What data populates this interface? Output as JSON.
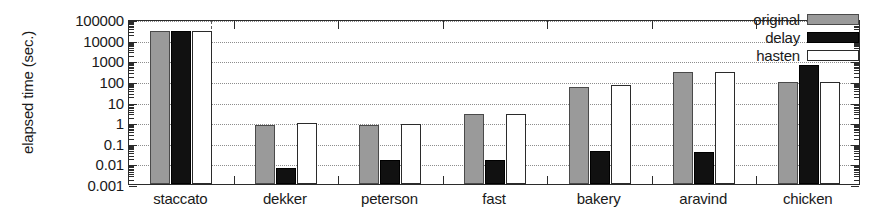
{
  "chart_data": {
    "type": "bar",
    "title": "",
    "xlabel": "",
    "ylabel": "elapsed time (sec.)",
    "yscale": "log",
    "ylim": [
      0.001,
      100000
    ],
    "ytick_labels": [
      "0.001",
      "0.01",
      "0.1",
      "1",
      "10",
      "100",
      "1000",
      "10000",
      "100000"
    ],
    "ytick_values": [
      0.001,
      0.01,
      0.1,
      1,
      10,
      100,
      1000,
      10000,
      100000
    ],
    "grid": "horizontal-dotted",
    "legend_position": "top-right",
    "categories": [
      "staccato",
      "dekker",
      "peterson",
      "fast",
      "bakery",
      "aravind",
      "chicken"
    ],
    "series": [
      {
        "name": "original",
        "color": "#9a9a9a",
        "values": [
          25000,
          0.7,
          0.7,
          2.5,
          50,
          280,
          90
        ]
      },
      {
        "name": "delay",
        "color": "#111111",
        "values": [
          25000,
          0.006,
          0.015,
          0.015,
          0.04,
          0.035,
          600
        ]
      },
      {
        "name": "hasten",
        "color": "#ffffff",
        "values": [
          25000,
          0.9,
          0.85,
          2.5,
          60,
          280,
          90
        ]
      }
    ],
    "separator_after_category": "staccato"
  },
  "legend": {
    "items": [
      {
        "label": "original",
        "key": "original"
      },
      {
        "label": "delay",
        "key": "delay"
      },
      {
        "label": "hasten",
        "key": "hasten"
      }
    ]
  }
}
